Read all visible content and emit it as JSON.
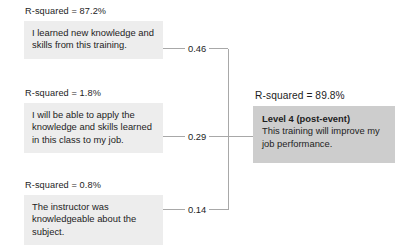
{
  "diagram": {
    "type": "path-model",
    "predictors": [
      {
        "rsquared_label": "R-squared = 87.2%",
        "statement": "I learned new knowledge and skills from this training.",
        "coefficient": "0.46"
      },
      {
        "rsquared_label": "R-squared = 1.8%",
        "statement": "I will be able to apply the knowledge and skills learned in this class to my job.",
        "coefficient": "0.29"
      },
      {
        "rsquared_label": "R-squared = 0.8%",
        "statement": "The instructor was knowledgeable about the subject.",
        "coefficient": "0.14"
      }
    ],
    "outcome": {
      "rsquared_label": "R-squared = 89.8%",
      "title": "Level 4 (post-event)",
      "statement": "This training will improve my job performance."
    },
    "colors": {
      "predictor_box_fill": "#ededed",
      "outcome_box_fill": "#cdcdcd",
      "connector_line": "#a8a8a8",
      "text": "#1d1d1d",
      "background": "#ffffff"
    }
  }
}
